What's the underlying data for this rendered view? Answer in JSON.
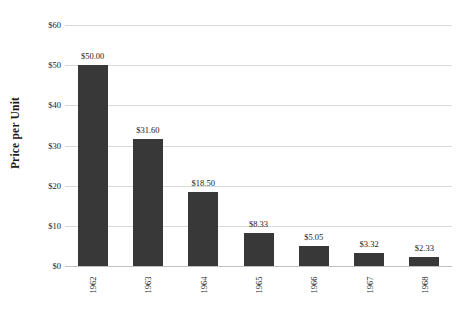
{
  "chart_data": {
    "type": "bar",
    "title": "",
    "xlabel": "",
    "ylabel": "Price per Unit",
    "categories": [
      "1962",
      "1963",
      "1964",
      "1965",
      "1966",
      "1967",
      "1968"
    ],
    "values": [
      50.0,
      31.6,
      18.5,
      8.33,
      5.05,
      3.32,
      2.33
    ],
    "value_labels": [
      "$50.00",
      "$31.60",
      "$18.50",
      "$8.33",
      "$5.05",
      "$3.32",
      "$2.33"
    ],
    "ylim": [
      0,
      60
    ],
    "ytick_values": [
      0,
      10,
      20,
      30,
      40,
      50,
      60
    ],
    "ytick_labels": [
      "$0",
      "$10",
      "$20",
      "$30",
      "$40",
      "$50",
      "$60"
    ],
    "grid": true,
    "legend": "none",
    "bar_color": "#383838",
    "gridline_color": "#d9d9d9",
    "background_color": "#ffffff",
    "text_color": "#1a1a1a"
  }
}
